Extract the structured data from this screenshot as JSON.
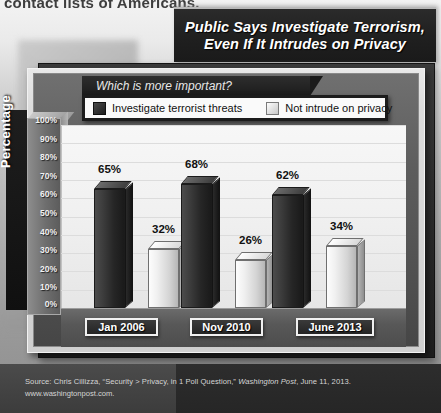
{
  "background": {
    "cut_off_text": "contact lists of Americans."
  },
  "title": {
    "line1": "Public Says Investigate Terrorism,",
    "line2": "Even If It Intrudes on Privacy"
  },
  "question_band": {
    "text": "Which is more important?"
  },
  "legend": [
    {
      "label": "Investigate terrorist threats",
      "swatch": "dark",
      "color": "#262626"
    },
    {
      "label": "Not intrude on privacy",
      "swatch": "light",
      "color": "#e0e0e0"
    }
  ],
  "axis": {
    "y_label": "Percentage",
    "y_ticks": [
      "100%",
      "90%",
      "80%",
      "70%",
      "60%",
      "50%",
      "40%",
      "30%",
      "20%",
      "10%",
      "0%"
    ]
  },
  "source": {
    "line1_a": "Source: Chris Cillizza, “Security > Privacy, in 1 Poll Question,” ",
    "line1_italic": "Washington Post",
    "line1_b": ", June 11, 2013.",
    "line2": "www.washingtonpost.com."
  },
  "chart_data": {
    "type": "bar",
    "title": "Public Says Investigate Terrorism, Even If It Intrudes on Privacy",
    "subtitle": "Which is more important?",
    "categories": [
      "Jan 2006",
      "Nov 2010",
      "June 2013"
    ],
    "series": [
      {
        "name": "Investigate terrorist threats",
        "values": [
          65,
          32,
          68
        ],
        "labels": [
          "65%",
          "68%",
          "62%"
        ],
        "color": "#262626"
      },
      {
        "name": "Not intrude on privacy",
        "values": [
          32,
          26,
          34
        ],
        "labels": [
          "32%",
          "26%",
          "34%"
        ],
        "color": "#e0e0e0"
      }
    ],
    "groups": [
      {
        "category": "Jan 2006",
        "investigate": 65,
        "not_intrude": 32
      },
      {
        "category": "Nov 2010",
        "investigate": 68,
        "not_intrude": 26
      },
      {
        "category": "June 2013",
        "investigate": 62,
        "not_intrude": 34
      }
    ],
    "xlabel": "",
    "ylabel": "Percentage",
    "ylim": [
      0,
      100
    ],
    "ytick_step": 10,
    "grid": true,
    "legend_position": "top"
  }
}
